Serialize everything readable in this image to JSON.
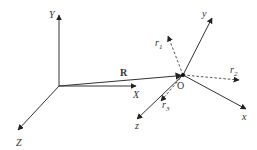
{
  "diagram": {
    "type": "coordinate-frames",
    "colors": {
      "line": "#333333",
      "dashed": "#555555",
      "text": "#333333"
    },
    "global_frame": {
      "origin": [
        59,
        86
      ],
      "axes": {
        "Y": {
          "label": "Y",
          "tip": [
            59,
            14
          ]
        },
        "Z": {
          "label": "Z",
          "tip": [
            17,
            131
          ]
        },
        "X": {
          "label": "X",
          "tip": [
            137,
            86
          ]
        }
      }
    },
    "position_vector": {
      "label": "R",
      "from": [
        59,
        86
      ],
      "to": [
        183,
        75
      ]
    },
    "local_frame": {
      "origin_label": "O",
      "origin": [
        183,
        75
      ],
      "axes": {
        "y": {
          "label": "y",
          "tip": [
            213,
            16
          ]
        },
        "x": {
          "label": "x",
          "tip": [
            247,
            110
          ]
        },
        "z": {
          "label": "z",
          "tip": [
            136,
            120
          ]
        }
      },
      "dashed_vectors": {
        "r1": {
          "label": "r",
          "subscript": "1",
          "tip": [
            168,
            35
          ]
        },
        "r2": {
          "label": "r",
          "subscript": "2",
          "tip": [
            240,
            80
          ]
        },
        "r3": {
          "label": "r",
          "subscript": "3",
          "tip": [
            160,
            102
          ]
        }
      }
    }
  }
}
